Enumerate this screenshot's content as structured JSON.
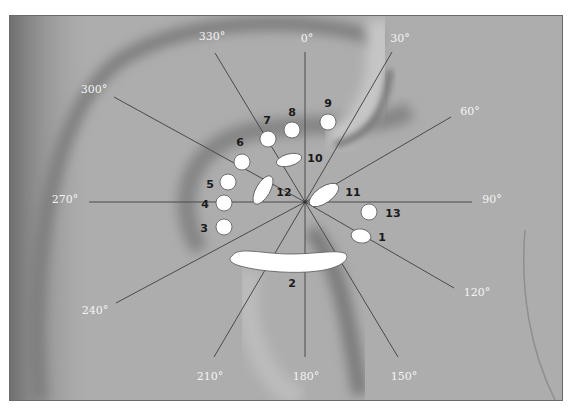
{
  "figure": {
    "frame": {
      "x": 9,
      "y": 15,
      "width": 554,
      "height": 386
    },
    "center": {
      "x": 305,
      "y": 202
    },
    "colors": {
      "background": "#ffffff",
      "photo_base": "#a9a9a9",
      "ray": "#4a4a4a",
      "angle_label": "#f4f4f4",
      "marker_fill": "#ffffff",
      "marker_label": "#1a1a1a"
    },
    "rays": [
      {
        "angle": "0°",
        "x2": 305,
        "y2": 52,
        "lx": 307,
        "ly": 42
      },
      {
        "angle": "30°",
        "x2": 392,
        "y2": 52,
        "lx": 400,
        "ly": 42
      },
      {
        "angle": "60°",
        "x2": 451,
        "y2": 117,
        "lx": 470,
        "ly": 115
      },
      {
        "angle": "90°",
        "x2": 472,
        "y2": 202,
        "lx": 492,
        "ly": 203
      },
      {
        "angle": "120°",
        "x2": 454,
        "y2": 288,
        "lx": 477,
        "ly": 296
      },
      {
        "angle": "150°",
        "x2": 398,
        "y2": 357,
        "lx": 404,
        "ly": 380
      },
      {
        "angle": "180°",
        "x2": 305,
        "y2": 357,
        "lx": 306,
        "ly": 380
      },
      {
        "angle": "210°",
        "x2": 214,
        "y2": 357,
        "lx": 210,
        "ly": 380
      },
      {
        "angle": "240°",
        "x2": 116,
        "y2": 303,
        "lx": 95,
        "ly": 314
      },
      {
        "angle": "270°",
        "x2": 89,
        "y2": 202,
        "lx": 65,
        "ly": 203
      },
      {
        "angle": "300°",
        "x2": 114,
        "y2": 97,
        "lx": 94,
        "ly": 93
      },
      {
        "angle": "330°",
        "x2": 215,
        "y2": 53,
        "lx": 212,
        "ly": 40
      }
    ],
    "markers": [
      {
        "id": "1",
        "shape": "ellipse",
        "cx": 361,
        "cy": 236,
        "rx": 10,
        "ry": 7,
        "rot": 10,
        "lx": 382,
        "ly": 241
      },
      {
        "id": "2",
        "shape": "band",
        "path": "M232,256 C238,246 262,254 290,254 C318,254 338,249 346,254 C350,260 340,268 318,271 C296,274 262,272 240,266 C230,263 228,259 232,256 Z",
        "lx": 292,
        "ly": 287
      },
      {
        "id": "3",
        "shape": "circle",
        "cx": 224,
        "cy": 227,
        "r": 8,
        "lx": 204,
        "ly": 232
      },
      {
        "id": "4",
        "shape": "circle",
        "cx": 224,
        "cy": 203,
        "r": 8,
        "lx": 205,
        "ly": 208
      },
      {
        "id": "5",
        "shape": "circle",
        "cx": 228,
        "cy": 182,
        "r": 8,
        "lx": 210,
        "ly": 188
      },
      {
        "id": "6",
        "shape": "circle",
        "cx": 242,
        "cy": 162,
        "r": 8,
        "lx": 240,
        "ly": 146
      },
      {
        "id": "7",
        "shape": "circle",
        "cx": 268,
        "cy": 139,
        "r": 8,
        "lx": 267,
        "ly": 124
      },
      {
        "id": "8",
        "shape": "circle",
        "cx": 292,
        "cy": 130,
        "r": 8,
        "lx": 292,
        "ly": 116
      },
      {
        "id": "9",
        "shape": "circle",
        "cx": 328,
        "cy": 122,
        "r": 8,
        "lx": 328,
        "ly": 107
      },
      {
        "id": "10",
        "shape": "ellipse",
        "cx": 289,
        "cy": 160,
        "rx": 13,
        "ry": 6,
        "rot": -15,
        "lx": 315,
        "ly": 162
      },
      {
        "id": "11",
        "shape": "ellipse",
        "cx": 324,
        "cy": 195,
        "rx": 17,
        "ry": 8,
        "rot": -35,
        "lx": 353,
        "ly": 196
      },
      {
        "id": "12",
        "shape": "ellipse",
        "cx": 263,
        "cy": 190,
        "rx": 16,
        "ry": 7,
        "rot": -60,
        "lx": 284,
        "ly": 196
      },
      {
        "id": "13",
        "shape": "circle",
        "cx": 369,
        "cy": 212,
        "r": 8,
        "lx": 393,
        "ly": 217
      }
    ]
  }
}
